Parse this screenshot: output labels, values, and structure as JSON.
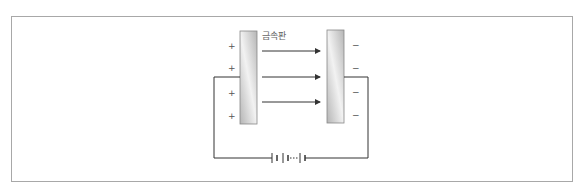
{
  "diagram": {
    "plate_label": "금속판",
    "left_plate_signs": [
      "+",
      "+",
      "+",
      "+"
    ],
    "right_plate_signs": [
      "−",
      "−",
      "−",
      "−"
    ],
    "field_arrows": 3,
    "battery": "battery-symbol",
    "colors": {
      "plate_fill_light": "#f2f2f2",
      "plate_fill_dark": "#b5b5b5",
      "line": "#333333",
      "frame": "#a8a8a8"
    }
  }
}
